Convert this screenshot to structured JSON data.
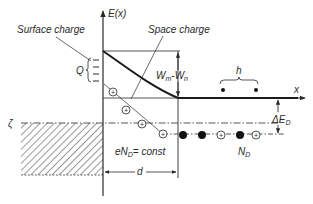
{
  "diagram": {
    "type": "energy-band-diagram",
    "colors": {
      "ink": "#2a2a2a",
      "background": "#ffffff"
    },
    "labels": {
      "y_axis": "E(x)",
      "x_axis": "x",
      "surface_charge": "Surface charge",
      "space_charge": "Space charge",
      "Q": "Q",
      "work_function_diff_main": "W",
      "work_function_diff_sub1": "m",
      "work_function_diff_dash": "-W",
      "work_function_diff_sub2": "n",
      "h": "h",
      "fermi": "ζ",
      "delta_e_main": "ΔE",
      "delta_e_sub": "D",
      "donor_density_main": "eN",
      "donor_density_sub": "D",
      "donor_density_rest": "= const",
      "depth": "d",
      "donors_main": "N",
      "donors_sub": "D"
    },
    "glyphs": {
      "plus": "+"
    },
    "ionized_donors_in_space_charge": 4,
    "donor_level_sequence": [
      "filled",
      "filled",
      "ionized",
      "filled",
      "ionized"
    ],
    "electrons_in_conduction_band": 2
  }
}
